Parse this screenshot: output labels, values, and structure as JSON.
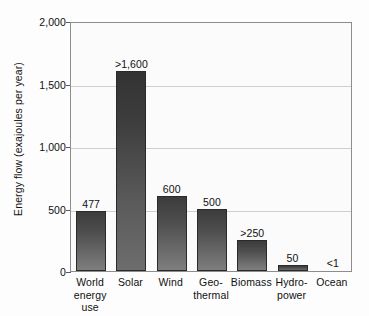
{
  "chart_data": {
    "type": "bar",
    "title": "",
    "xlabel": "",
    "ylabel": "Energy flow (exajoules per year)",
    "ylim": [
      0,
      2000
    ],
    "yticks": [
      "0",
      "500",
      "1,000",
      "1,500",
      "2,000"
    ],
    "ytick_values": [
      0,
      500,
      1000,
      1500,
      2000
    ],
    "grid": true,
    "legend": "none",
    "categories": [
      "World energy use",
      "Solar",
      "Wind",
      "Geo-thermal",
      "Biomass",
      "Hydro-power",
      "Ocean"
    ],
    "category_lines": [
      [
        "World",
        "energy use"
      ],
      [
        "Solar",
        ""
      ],
      [
        "Wind",
        ""
      ],
      [
        "Geo-",
        "thermal"
      ],
      [
        "Biomass",
        ""
      ],
      [
        "Hydro-",
        "power"
      ],
      [
        "Ocean",
        ""
      ]
    ],
    "values": [
      477,
      1600,
      600,
      500,
      250,
      50,
      1
    ],
    "value_labels": [
      "477",
      ">1,600",
      "600",
      "500",
      ">250",
      "50",
      "<1"
    ]
  },
  "style": {
    "bar_color_top": "#3c3c3c",
    "bar_color_bottom": "#7e7e7e",
    "plot_background": "#fbfbfb",
    "frame_color": "#8d8d8d",
    "gridline_color": "#cfcfcf",
    "text_color": "#101010"
  }
}
